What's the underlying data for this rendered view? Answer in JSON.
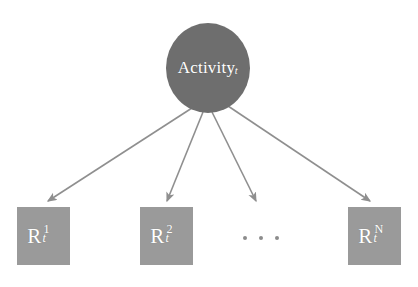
{
  "diagram": {
    "type": "graphical-model",
    "background_color": "#ffffff",
    "root_node": {
      "shape": "ellipse",
      "label_base": "Activity",
      "label_subscript": "t",
      "fill_color": "#6e6e6e",
      "text_color": "#ffffff",
      "center_x": 208,
      "center_y": 68,
      "radius_x": 42,
      "radius_y": 45
    },
    "leaf_nodes": [
      {
        "shape": "rectangle",
        "label_base": "R",
        "label_superscript": "1",
        "label_subscript": "t",
        "fill_color": "#9a9a9a",
        "text_color": "#ffffff",
        "x": 17,
        "y": 207,
        "width": 53,
        "height": 58
      },
      {
        "shape": "rectangle",
        "label_base": "R",
        "label_superscript": "2",
        "label_subscript": "t",
        "fill_color": "#9a9a9a",
        "text_color": "#ffffff",
        "x": 140,
        "y": 207,
        "width": 53,
        "height": 58
      },
      {
        "shape": "rectangle",
        "label_base": "R",
        "label_superscript": "N",
        "label_subscript": "t",
        "fill_color": "#9a9a9a",
        "text_color": "#ffffff",
        "x": 348,
        "y": 207,
        "width": 53,
        "height": 58
      }
    ],
    "ellipsis": {
      "label": "...",
      "dot_count": 3,
      "color": "#8c8c8c"
    },
    "edges": [
      {
        "from": "Activity_t",
        "to": "R^1_t",
        "x1": 192,
        "y1": 108,
        "x2": 48,
        "y2": 203,
        "arrowhead": true
      },
      {
        "from": "Activity_t",
        "to": "R^2_t",
        "x1": 203,
        "y1": 112,
        "x2": 167,
        "y2": 203,
        "arrowhead": true
      },
      {
        "from": "Activity_t",
        "to": "(omitted)",
        "x1": 212,
        "y1": 112,
        "x2": 256,
        "y2": 203,
        "arrowhead": true
      },
      {
        "from": "Activity_t",
        "to": "R^N_t",
        "x1": 228,
        "y1": 106,
        "x2": 370,
        "y2": 203,
        "arrowhead": true
      }
    ],
    "edge_color": "#8f8f8f",
    "edge_width": 1.6
  }
}
